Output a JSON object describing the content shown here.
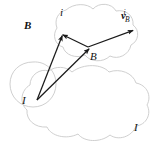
{
  "figure": {
    "background_color": "#ffffff",
    "line_color": "#1a1a1a",
    "blob_color": "#cccccc"
  },
  "labels": {
    "frame_b_bold": "B",
    "point_i": "i",
    "frame_b_mid": "B",
    "frame_i_origin": "I",
    "frame_i_outer": "I"
  },
  "vector_label": {
    "symbol": "v",
    "subscript": "B",
    "superscript": "i"
  },
  "geometry": {
    "origin_I": [
      37,
      100
    ],
    "vertex_i": [
      61,
      34
    ],
    "vertex_B": [
      88,
      47
    ],
    "tip_v": [
      134,
      30
    ],
    "arrows": [
      {
        "name": "I-to-i",
        "from": [
          37,
          100
        ],
        "to": [
          61,
          34
        ]
      },
      {
        "name": "I-to-B",
        "from": [
          37,
          100
        ],
        "to": [
          88,
          47
        ]
      },
      {
        "name": "B-to-i",
        "from": [
          88,
          47
        ],
        "to": [
          61,
          34
        ]
      },
      {
        "name": "B-to-v",
        "from": [
          88,
          47
        ],
        "to": [
          134,
          30
        ]
      }
    ]
  }
}
